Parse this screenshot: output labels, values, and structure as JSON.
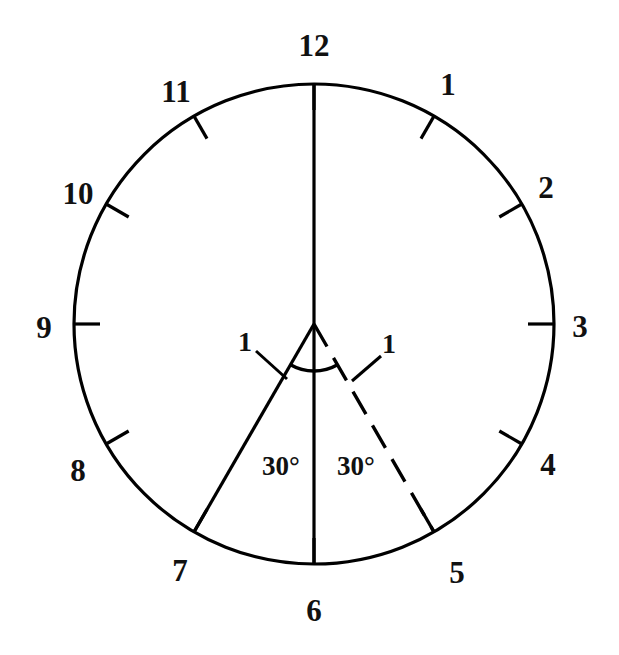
{
  "figure": {
    "background_color": "#ffffff",
    "stroke_color": "#000000"
  },
  "chart_data": {
    "type": "diagram",
    "subtype": "clock-face-angle-diagram",
    "title": "",
    "center": {
      "x": 314,
      "y": 324
    },
    "radius": 240,
    "hour_count": 12,
    "degrees_per_hour": 30,
    "hour_labels": [
      {
        "hour": "12",
        "angle_deg": 0,
        "x": 314,
        "y": 45
      },
      {
        "hour": "1",
        "angle_deg": 30,
        "x": 448,
        "y": 84
      },
      {
        "hour": "2",
        "angle_deg": 60,
        "x": 546,
        "y": 187
      },
      {
        "hour": "3",
        "angle_deg": 90,
        "x": 580,
        "y": 326
      },
      {
        "hour": "4",
        "angle_deg": 120,
        "x": 548,
        "y": 464
      },
      {
        "hour": "5",
        "angle_deg": 150,
        "x": 457,
        "y": 572
      },
      {
        "hour": "6",
        "angle_deg": 180,
        "x": 314,
        "y": 610
      },
      {
        "hour": "7",
        "angle_deg": 210,
        "x": 180,
        "y": 570
      },
      {
        "hour": "8",
        "angle_deg": 240,
        "x": 78,
        "y": 470
      },
      {
        "hour": "9",
        "angle_deg": 270,
        "x": 44,
        "y": 327
      },
      {
        "hour": "10",
        "angle_deg": 300,
        "x": 78,
        "y": 193
      },
      {
        "hour": "11",
        "angle_deg": 330,
        "x": 176,
        "y": 91
      }
    ],
    "tick_marks": {
      "count": 12,
      "direction": "inward",
      "length": 26,
      "note": "short radial ticks at every hour position on the circle"
    },
    "radii_drawn": [
      {
        "name": "twelve-oclock-radius",
        "angle_deg": 0,
        "style": "solid"
      },
      {
        "name": "six-oclock-radius",
        "angle_deg": 180,
        "style": "solid"
      },
      {
        "name": "seven-oclock-radius",
        "angle_deg": 210,
        "style": "solid"
      },
      {
        "name": "five-oclock-radius",
        "angle_deg": 150,
        "style": "dashed"
      }
    ],
    "angle_arc": {
      "from_angle_deg": 150,
      "to_angle_deg": 210,
      "radius": 47,
      "total_deg": 60
    },
    "annotations": [
      {
        "name": "angle-label-left",
        "text": "30°",
        "x": 281,
        "y": 466
      },
      {
        "name": "angle-label-right",
        "text": "30°",
        "x": 356,
        "y": 466
      },
      {
        "name": "unit-label-left",
        "text": "1",
        "x": 245,
        "y": 342
      },
      {
        "name": "unit-label-right",
        "text": "1",
        "x": 389,
        "y": 344
      }
    ],
    "leader_lines": [
      {
        "name": "leader-left",
        "from": {
          "x": 256,
          "y": 351
        },
        "to": {
          "x": 285,
          "y": 378
        }
      },
      {
        "name": "leader-right",
        "from": {
          "x": 380,
          "y": 357
        },
        "to": {
          "x": 353,
          "y": 381
        }
      }
    ]
  },
  "labels": {
    "hours": {
      "h12": "12",
      "h1": "1",
      "h2": "2",
      "h3": "3",
      "h4": "4",
      "h5": "5",
      "h6": "6",
      "h7": "7",
      "h8": "8",
      "h9": "9",
      "h10": "10",
      "h11": "11"
    },
    "angles": {
      "left": "30°",
      "right": "30°"
    },
    "units": {
      "left": "1",
      "right": "1"
    }
  }
}
